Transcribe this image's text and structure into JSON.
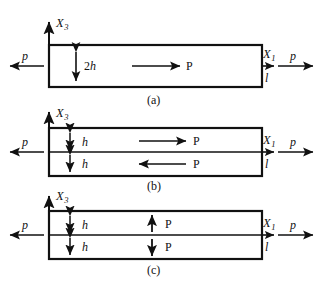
{
  "figure": {
    "width": 323,
    "height": 296,
    "background_color": "#ffffff",
    "line_color": "#111111"
  },
  "labels": {
    "axis_x3": "X",
    "axis_x3_sub": "3",
    "axis_x1": "X",
    "axis_x1_sub": "1",
    "load_p": "p",
    "force_P": "P",
    "length_l": "l",
    "thickness_full": "2h",
    "thickness_half": "h",
    "panel_a": "(a)",
    "panel_b": "(b)",
    "panel_c": "(c)"
  },
  "panels": [
    {
      "id": "a",
      "caption": "(a)",
      "box": {
        "x": 49,
        "y": 45,
        "width": 213,
        "height": 42
      },
      "axis_vertical_label": "X3",
      "axis_horizontal_label": "X1",
      "left_load_label": "p",
      "right_load_label": "p",
      "length_label": "l",
      "thickness_label": "2h",
      "thickness_marker": "double-arrow-vertical",
      "divided": false,
      "internal_forces": [
        {
          "label": "P",
          "direction": "right",
          "region": "full"
        }
      ]
    },
    {
      "id": "b",
      "caption": "(b)",
      "box": {
        "x": 49,
        "y": 128,
        "width": 213,
        "height": 48
      },
      "axis_vertical_label": "X3",
      "axis_horizontal_label": "X1",
      "left_load_label": "p",
      "right_load_label": "p",
      "length_label": "l",
      "thickness_labels": [
        "h",
        "h"
      ],
      "thickness_marker": "double-arrow-vertical",
      "divided": true,
      "internal_forces": [
        {
          "label": "P",
          "direction": "right",
          "region": "upper"
        },
        {
          "label": "P",
          "direction": "left",
          "region": "lower"
        }
      ]
    },
    {
      "id": "c",
      "caption": "(c)",
      "box": {
        "x": 49,
        "y": 211,
        "width": 213,
        "height": 48
      },
      "axis_vertical_label": "X3",
      "axis_horizontal_label": "X1",
      "left_load_label": "p",
      "right_load_label": "p",
      "length_label": "l",
      "thickness_labels": [
        "h",
        "h"
      ],
      "thickness_marker": "double-arrow-vertical",
      "divided": true,
      "internal_forces": [
        {
          "label": "P",
          "direction": "up",
          "region": "upper"
        },
        {
          "label": "P",
          "direction": "down",
          "region": "lower"
        }
      ]
    }
  ]
}
